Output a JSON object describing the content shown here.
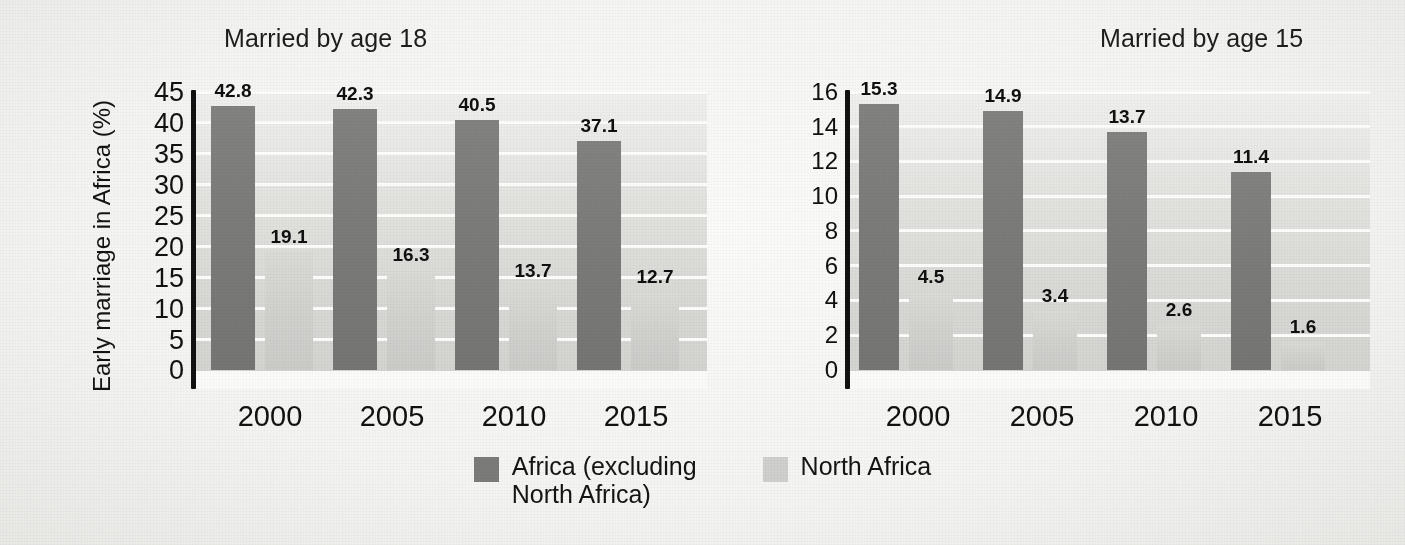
{
  "axis": {
    "y_label": "Early marriage in Africa (%)"
  },
  "legend": {
    "items": [
      {
        "label": "Africa (excluding\nNorth Africa)",
        "color": "#7b7b7a",
        "name": "africa-excluding-north-africa"
      },
      {
        "label": "North Africa",
        "color": "#cfcfcc",
        "name": "north-africa"
      }
    ]
  },
  "panels": [
    {
      "title": "Married by age 18",
      "ticks": [
        "45",
        "40",
        "35",
        "30",
        "25",
        "20",
        "15",
        "10",
        "5",
        "0"
      ],
      "xlabels": [
        "2000",
        "2005",
        "2010",
        "2015"
      ],
      "labels_dark": [
        "42.8",
        "42.3",
        "40.5",
        "37.1"
      ],
      "labels_light": [
        "19.1",
        "16.3",
        "13.7",
        "12.7"
      ]
    },
    {
      "title": "Married by age 15",
      "ticks": [
        "16",
        "14",
        "12",
        "10",
        "8",
        "6",
        "4",
        "2",
        "0"
      ],
      "xlabels": [
        "2000",
        "2005",
        "2010",
        "2015"
      ],
      "labels_dark": [
        "15.3",
        "14.9",
        "13.7",
        "11.4"
      ],
      "labels_light": [
        "4.5",
        "3.4",
        "2.6",
        "1.6"
      ]
    }
  ],
  "chart_data": [
    {
      "type": "bar",
      "title": "Married by age 18",
      "categories": [
        "2000",
        "2005",
        "2010",
        "2015"
      ],
      "series": [
        {
          "name": "Africa (excluding North Africa)",
          "values": [
            42.8,
            42.3,
            40.5,
            37.1
          ],
          "color": "#7b7b7a"
        },
        {
          "name": "North Africa",
          "values": [
            19.1,
            16.3,
            13.7,
            12.7
          ],
          "color": "#cfcfcc"
        }
      ],
      "xlabel": "",
      "ylabel": "Early marriage in Africa (%)",
      "ylim": [
        0,
        45
      ],
      "ytick_step": 5,
      "yticks": [
        0,
        5,
        10,
        15,
        20,
        25,
        30,
        35,
        40,
        45
      ],
      "grid": true,
      "legend_position": "bottom-center",
      "data_labels": true
    },
    {
      "type": "bar",
      "title": "Married by age 15",
      "categories": [
        "2000",
        "2005",
        "2010",
        "2015"
      ],
      "series": [
        {
          "name": "Africa (excluding North Africa)",
          "values": [
            15.3,
            14.9,
            13.7,
            11.4
          ],
          "color": "#7b7b7a"
        },
        {
          "name": "North Africa",
          "values": [
            4.5,
            3.4,
            2.6,
            1.6
          ],
          "color": "#cfcfcc"
        }
      ],
      "xlabel": "",
      "ylabel": "Early marriage in Africa (%)",
      "ylim": [
        0,
        16
      ],
      "ytick_step": 2,
      "yticks": [
        0,
        2,
        4,
        6,
        8,
        10,
        12,
        14,
        16
      ],
      "grid": true,
      "legend_position": "bottom-center",
      "data_labels": true
    }
  ]
}
